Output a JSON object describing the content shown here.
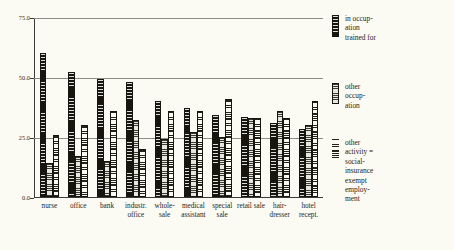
{
  "chart_data": {
    "type": "bar",
    "title": "",
    "subtitle": "",
    "xlabel": "",
    "ylabel": "",
    "ylim": [
      0,
      75
    ],
    "yticks": [
      "0.0",
      "25.0",
      "50.0",
      "75.0"
    ],
    "ytick_values": [
      0,
      25,
      50,
      75
    ],
    "grid": true,
    "legend_position": "right",
    "categories": [
      "nurse",
      "office",
      "bank",
      "industr. office",
      "whole- sale",
      "medical assistant",
      "special sale",
      "retail sale",
      "hair- dresser",
      "hotel recept."
    ],
    "series": [
      {
        "name": "in occup-\nation\ntrained for",
        "key": "in occupation trained for",
        "pattern": "solid-dark",
        "color": "#17150e",
        "values": [
          60.0,
          52.0,
          49.0,
          48.0,
          40.0,
          37.0,
          34.0,
          33.5,
          31.0,
          28.5
        ]
      },
      {
        "name": "other\noccup-\nation",
        "key": "other occupation",
        "pattern": "horizontal-lines-gray",
        "color": "#c9c8bd",
        "values": [
          14.0,
          17.0,
          15.0,
          32.0,
          24.0,
          27.0,
          25.0,
          33.0,
          36.0,
          30.0
        ]
      },
      {
        "name": "other\nactivity =\nsocial-\ninsurance\nexempt\nemploy-\nment",
        "key": "other activity = social-insurance exempt employment",
        "pattern": "wavy-hatch-white",
        "color": "#fbfaf3",
        "values": [
          26.0,
          30.0,
          36.0,
          20.0,
          36.0,
          36.0,
          41.0,
          33.0,
          33.0,
          40.0
        ]
      }
    ]
  },
  "legend": {
    "entries": [
      {
        "label": "in occup-\nation\ntrained for"
      },
      {
        "label": "other\noccup-\nation"
      },
      {
        "label": "other\nactivity =\nsocial-\ninsurance\nexempt\nemploy-\nment"
      }
    ]
  },
  "yaxis": {
    "labels": [
      "75.0",
      "50.0",
      "25.0",
      "0.0"
    ]
  }
}
